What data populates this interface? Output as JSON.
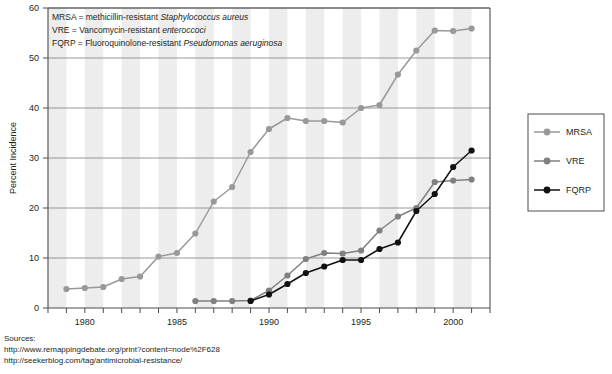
{
  "chart_data": {
    "type": "line",
    "title": "",
    "xlabel": "",
    "ylabel": "Percent Incidence",
    "xlim": [
      1978,
      2002
    ],
    "ylim": [
      0,
      60
    ],
    "yticks": [
      0,
      10,
      20,
      30,
      40,
      50,
      60
    ],
    "xticks": [
      1978,
      1979,
      1980,
      1981,
      1982,
      1983,
      1984,
      1985,
      1986,
      1987,
      1988,
      1989,
      1990,
      1991,
      1992,
      1993,
      1994,
      1995,
      1996,
      1997,
      1998,
      1999,
      2000,
      2001,
      2002
    ],
    "xticklabels": [
      "1980",
      "1985",
      "1990",
      "1995",
      "2000"
    ],
    "xticklabel_values": [
      1980,
      1985,
      1990,
      1995,
      2000
    ],
    "grid": "horizontal gridlines at each y tick; vertical alternating grey/white year bands",
    "legend_position": "right outside",
    "series": [
      {
        "name": "MRSA",
        "color": "#999999",
        "marker": "circle",
        "x": [
          1979,
          1980,
          1981,
          1982,
          1983,
          1984,
          1985,
          1986,
          1987,
          1988,
          1989,
          1990,
          1991,
          1992,
          1993,
          1994,
          1995,
          1996,
          1997,
          1998,
          1999,
          2000,
          2001
        ],
        "y": [
          3.8,
          4.0,
          4.2,
          5.8,
          6.3,
          10.3,
          11.0,
          14.9,
          21.3,
          24.2,
          31.2,
          35.8,
          38.0,
          37.4,
          37.4,
          37.1,
          40.0,
          40.6,
          46.7,
          51.5,
          55.5,
          55.4,
          55.9
        ]
      },
      {
        "name": "VRE",
        "color": "#808080",
        "marker": "circle",
        "x": [
          1986,
          1987,
          1988,
          1989,
          1990,
          1991,
          1992,
          1993,
          1994,
          1995,
          1996,
          1997,
          1998,
          1999,
          2000,
          2001
        ],
        "y": [
          1.4,
          1.4,
          1.4,
          1.5,
          3.5,
          6.5,
          9.8,
          11.0,
          10.9,
          11.5,
          15.5,
          18.3,
          20.0,
          25.2,
          25.5,
          25.7
        ]
      },
      {
        "name": "FQRP",
        "color": "#111111",
        "marker": "circle",
        "x": [
          1989,
          1990,
          1991,
          1992,
          1993,
          1994,
          1995,
          1996,
          1997,
          1998,
          1999,
          2000,
          2001
        ],
        "y": [
          1.4,
          2.7,
          4.8,
          7.0,
          8.3,
          9.6,
          9.6,
          11.8,
          13.1,
          19.4,
          22.8,
          28.2,
          31.5
        ]
      }
    ],
    "annotations": [
      "MRSA = methicillin-resistant Staphylococcus aureus",
      "VRE = Vancomycin-resistant enteroccoci",
      "FQRP = Fluoroquinolone-resistant Pseudomonas aeruginosa"
    ],
    "annotation_parts": [
      {
        "plain": "MRSA = methicillin-resistant ",
        "italic": "Staphylococcus aureus"
      },
      {
        "plain": "VRE = Vancomycin-resistant ",
        "italic": "enteroccoci"
      },
      {
        "plain": "FQRP = Fluoroquinolone-resistant ",
        "italic": "Pseudomonas aeruginosa"
      }
    ]
  },
  "legend": {
    "items": [
      {
        "label": "MRSA",
        "color": "#999999"
      },
      {
        "label": "VRE",
        "color": "#808080"
      },
      {
        "label": "FQRP",
        "color": "#111111"
      }
    ]
  },
  "sources": {
    "heading": "Sources:",
    "lines": [
      "http://www.remappingdebate.org/print?content=node%2F628",
      "http://seekerblog.com/tag/antimicrobial-resistance/"
    ]
  },
  "colors": {
    "band": "#ededed",
    "grid": "#8c8c8c",
    "axis": "#4d4d4d",
    "text": "#231f20"
  }
}
